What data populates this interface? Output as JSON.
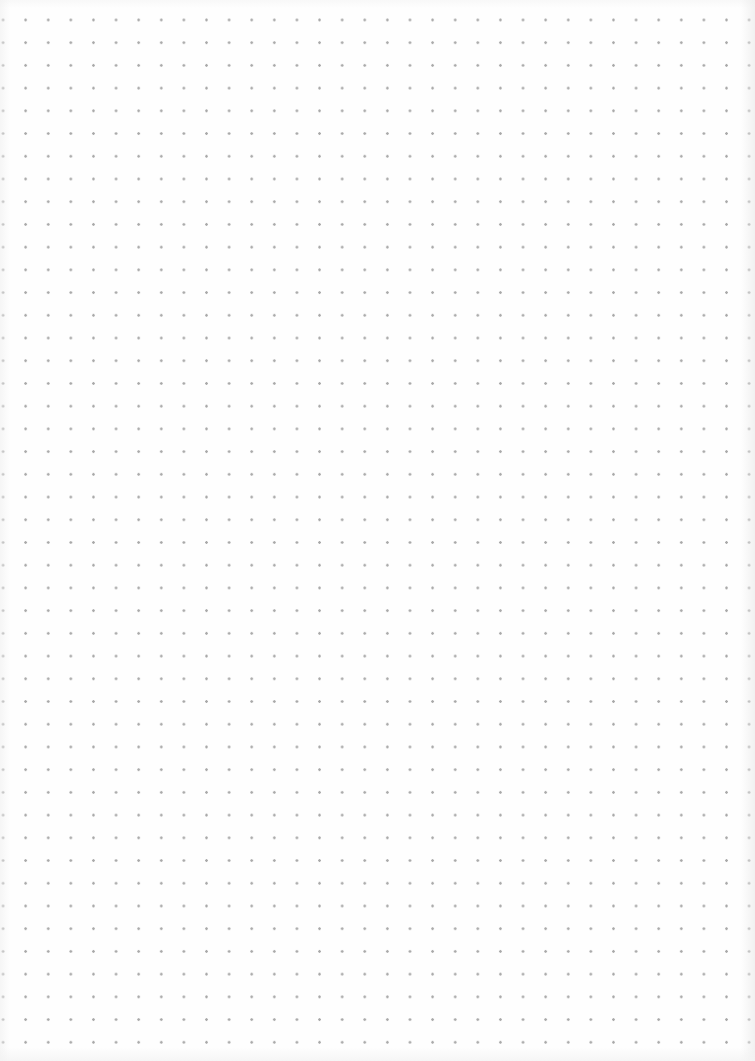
{
  "page": {
    "type": "dot-grid",
    "dot_color": "#8c8c8c",
    "background_color": "#fefefe",
    "columns": 34,
    "rows": 45,
    "spacing_px": 22.7
  }
}
